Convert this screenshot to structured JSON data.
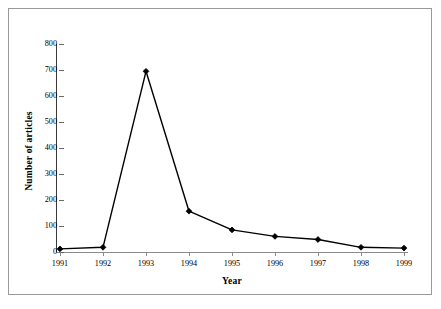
{
  "chart_data": {
    "type": "line",
    "title": "",
    "xlabel": "Year",
    "ylabel": "Number of articles",
    "categories": [
      "1991",
      "1992",
      "1993",
      "1994",
      "1995",
      "1996",
      "1997",
      "1998",
      "1999"
    ],
    "values": [
      12,
      18,
      695,
      157,
      85,
      60,
      48,
      18,
      15
    ],
    "series": [
      {
        "name": "Number of articles",
        "values": [
          12,
          18,
          695,
          157,
          85,
          60,
          48,
          18,
          15
        ]
      }
    ],
    "ylim": [
      0,
      800
    ],
    "yticks": [
      0,
      100,
      200,
      300,
      400,
      500,
      600,
      700,
      800
    ],
    "ytick_labels": [
      "0",
      "100",
      "200",
      "300",
      "400",
      "500",
      "600",
      "700",
      "800"
    ],
    "xtick_labels": [
      "1991",
      "1992",
      "1993",
      "1994",
      "1995",
      "1996",
      "1997",
      "1998",
      "1999"
    ],
    "grid": false,
    "legend": "none",
    "line_color": "#000000",
    "marker": "diamond",
    "marker_color": "#000000",
    "background_color": "#ffffff",
    "frame_color": "#9a9a9a"
  }
}
